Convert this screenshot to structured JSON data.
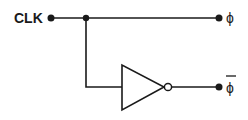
{
  "diagram": {
    "type": "logic-circuit",
    "colors": {
      "line": "#1a1a1a",
      "background": "#ffffff"
    },
    "input": {
      "label": "CLK"
    },
    "outputs": [
      {
        "id": "phi",
        "label": "ϕ"
      },
      {
        "id": "phi_bar",
        "label": "ϕ",
        "overline": true
      }
    ],
    "components": [
      {
        "type": "inverter",
        "symbol": "triangle-with-bubble"
      }
    ]
  }
}
